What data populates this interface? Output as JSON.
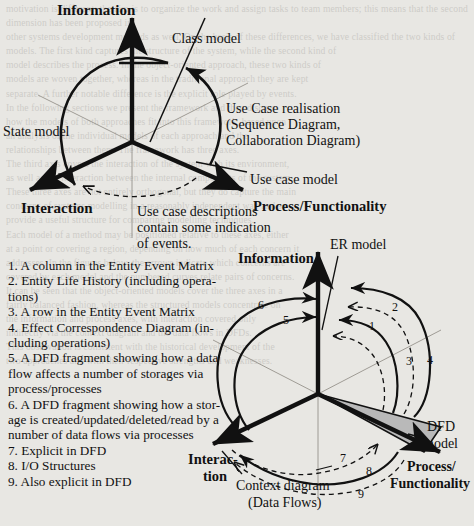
{
  "page": {
    "background_color": "#e8e7e3",
    "ink_color": "#111111",
    "shade_color": "#b9b9b9",
    "background_bleed_text": "scanned page text bleed-through"
  },
  "top_diagram": {
    "name": "UML three-axis model diagram",
    "axes": [
      {
        "id": "information",
        "label": "Information",
        "bold": true
      },
      {
        "id": "interaction",
        "label": "Interaction",
        "bold": true
      },
      {
        "id": "process",
        "label": "Process/Functionality",
        "bold": true
      }
    ],
    "annotations": [
      {
        "id": "class-model",
        "label": "Class model"
      },
      {
        "id": "state-model",
        "label": "State model"
      },
      {
        "id": "use-case-model",
        "label": "Use case model"
      },
      {
        "id": "use-case-realisation",
        "lines": [
          "Use Case realisation",
          "(Sequence Diagram,",
          "Collaboration Diagram)"
        ]
      },
      {
        "id": "use-case-descriptions",
        "lines": [
          "Use case descriptions",
          "contain some indication",
          "of events."
        ]
      }
    ]
  },
  "legend_list": {
    "name": "numbered explanation list",
    "items": [
      "1. A column in the Entity Event Matrix",
      "2. Entity Life History (including opera-\ntions)",
      "3. A row in the Entity Event Matrix",
      "4. Effect Correspondence Diagram (in-\ncluding operations)",
      "5. A DFD fragment showing how a data\nflow affects a number of storages via\nprocess/processes",
      "6. A DFD fragment showing how a stor-\nage is created/updated/deleted/read by a\nnumber of data flows via processes",
      "7. Explicit in DFD",
      "8. I/O Structures",
      "9. Also explicit in DFD"
    ]
  },
  "bottom_diagram": {
    "name": "SSADM three-axis model diagram",
    "axes": [
      {
        "id": "information",
        "label": "Information",
        "bold": true
      },
      {
        "id": "interaction",
        "lines": [
          "Interac-",
          "tion"
        ],
        "bold": true
      },
      {
        "id": "process",
        "lines": [
          "Process/",
          "Functionality"
        ],
        "bold": true
      }
    ],
    "annotations": [
      {
        "id": "er-model",
        "label": "ER model"
      },
      {
        "id": "dfd-model",
        "lines": [
          "DFD",
          "model"
        ]
      },
      {
        "id": "context-diagram",
        "lines": [
          "Context diagram",
          "(Data Flows)"
        ]
      }
    ],
    "curve_numbers": [
      {
        "id": "curve-1",
        "label": "1",
        "style": "dashed"
      },
      {
        "id": "curve-2",
        "label": "2",
        "style": "dashed"
      },
      {
        "id": "curve-3",
        "label": "3",
        "style": "dashed"
      },
      {
        "id": "curve-4",
        "label": "4",
        "style": "solid"
      },
      {
        "id": "curve-5",
        "label": "5",
        "style": "solid"
      },
      {
        "id": "curve-6",
        "label": "6",
        "style": "solid"
      },
      {
        "id": "curve-7",
        "label": "7",
        "style": "dashed"
      },
      {
        "id": "curve-8",
        "label": "8",
        "style": "solid"
      },
      {
        "id": "curve-9",
        "label": "9",
        "style": "dashed"
      }
    ]
  },
  "bleed": {
    "l1": "motivation is different: the aim is to organize the work and assign tasks to team members; this means that the second dimension has been proposed in",
    "l2": "other systems development methods as well. On the basis of these differences, we have classified the two kinds of",
    "l3": "models. The first kind captures the structure of the system, while the second kind of",
    "l4": "model describes the process. In the object-oriented approach, these two kinds of",
    "l5": "models are woven together, whereas in the traditional approach they are kept",
    "l6": "separate. A further notable difference is the explicit role played by events.",
    "l7": "In the following sections we present the framework and then discuss",
    "l8": "how the models of both approaches fit into this framework, based upon",
    "l9": "an analysis of the individual models of each approach and the",
    "l10": "relationships between them. The framework has three axes.",
    "l11": "The third axis covers the interaction of the system with its environment,",
    "l12": "as well as the interaction between the internal components of the system.",
    "l13": "These three axes are not entirely orthogonal, but they do capture the main",
    "l14": "concerns of systems modelling in a reasonably independent way and so",
    "l15": "provide a useful structure for comparing modelling techniques.",
    "l16": "Each model of a method may be positioned relative to these axes, either",
    "l17": "at a point or covering a region, depending on how much of each concern it",
    "l18": "addresses. In the figures below, the arrows indicate which concerns are",
    "l19": "covered by each model and the numbered curves relate pairs of concerns.",
    "l20": "It can be seen that the object-oriented models cover the three axes in a",
    "l21": "fairly balanced fashion, whereas the structured models concentrate on",
    "l22": "the information and process axes, with interaction covered only",
    "l23": "indirectly via the context diagram and the data flows in DFDs.",
    "l24": "This observation is consistent with the historical development of the",
    "l25": "two approaches and with their respective strengths and weaknesses."
  }
}
